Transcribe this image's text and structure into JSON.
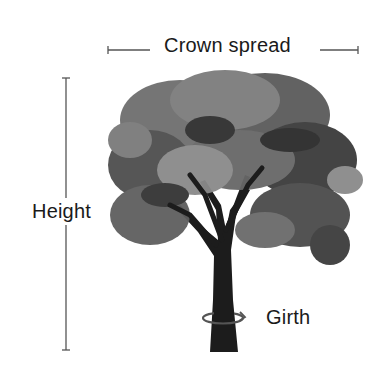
{
  "diagram": {
    "labels": {
      "crown_spread": "Crown spread",
      "height": "Height",
      "girth": "Girth"
    },
    "colors": {
      "line": "#555555",
      "text": "#1a1a1a",
      "tree_dark": "#1c1c1c",
      "tree_mid": "#5a5a5a",
      "tree_light": "#8c8c8c"
    },
    "icons": [
      "crown-spread-arrow-icon",
      "height-arrow-icon",
      "girth-rotation-arrow-icon",
      "tree-illustration"
    ]
  }
}
